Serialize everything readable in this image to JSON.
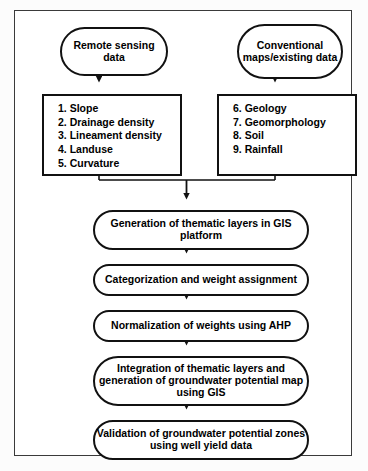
{
  "diagram": {
    "title_text": "",
    "sources": [
      {
        "id": "remote-sensing",
        "label": "Remote sensing data"
      },
      {
        "id": "conventional",
        "label": "Conventional maps/existing data"
      }
    ],
    "parameter_boxes": [
      {
        "id": "remote-params",
        "items": [
          "1. Slope",
          "2. Drainage density",
          "3. Lineament density",
          "4. Landuse",
          "5. Curvature"
        ]
      },
      {
        "id": "conventional-params",
        "items": [
          "6. Geology",
          "7. Geomorphology",
          "8. Soil",
          "9. Rainfall"
        ]
      }
    ],
    "process_steps": [
      {
        "id": "generation",
        "label": "Generation of thematic layers in GIS platform"
      },
      {
        "id": "categorization",
        "label": "Categorization and weight assignment"
      },
      {
        "id": "normalization",
        "label": "Normalization of weights using AHP"
      },
      {
        "id": "integration",
        "label": "Integration of thematic layers and generation of groundwater potential map using GIS"
      },
      {
        "id": "validation",
        "label": "Validation of groundwater potential zones using well yield data"
      }
    ],
    "colors": {
      "stroke": "#111111",
      "frame_stroke": "#3a3a3a",
      "background": "#ffffff",
      "text": "#000000"
    }
  }
}
